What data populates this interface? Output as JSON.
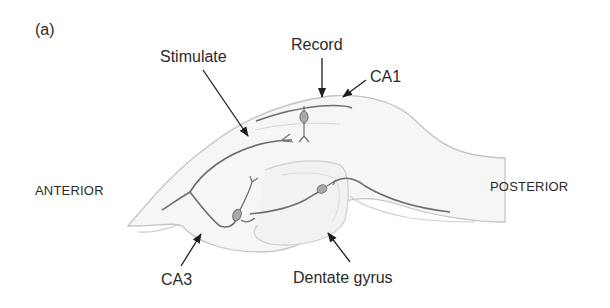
{
  "figure": {
    "panel_label": "(a)",
    "labels": {
      "stimulate": "Stimulate",
      "record": "Record",
      "ca1": "CA1",
      "anterior": "ANTERIOR",
      "posterior": "POSTERIOR",
      "ca3": "CA3",
      "dentate_gyrus": "Dentate gyrus"
    },
    "colors": {
      "outline": "#c4c4c4",
      "fill": "#f6f6f6",
      "axon": "#6e6e6e",
      "soma": "#a9a9a9",
      "arrow": "#1e1e1e",
      "text": "#2a2a2a"
    }
  }
}
